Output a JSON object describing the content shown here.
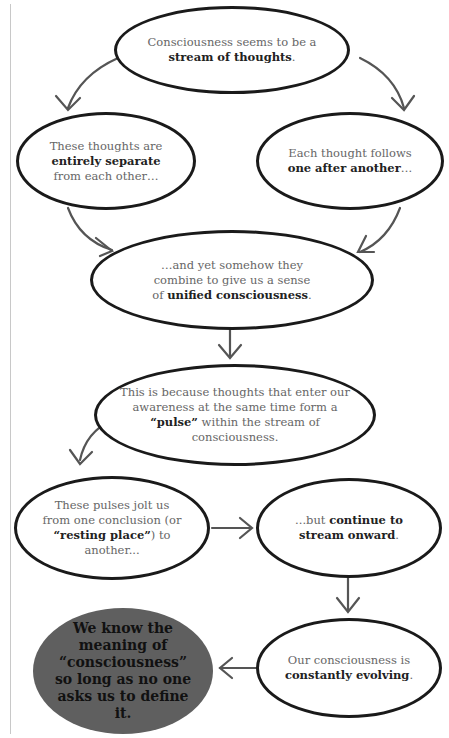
{
  "diagram": {
    "type": "flowchart",
    "nodes": [
      {
        "id": "n1",
        "pre": "Consciousness seems to be a ",
        "bold": "stream of thoughts",
        "post": "."
      },
      {
        "id": "n2",
        "pre": "These thoughts are ",
        "bold": "entirely separate",
        "post": " from each other…"
      },
      {
        "id": "n3",
        "pre": "Each thought follows ",
        "bold": "one after another",
        "post": "…"
      },
      {
        "id": "n4",
        "pre": "…and yet somehow they combine to give us a sense of ",
        "bold": "unified consciousness",
        "post": "."
      },
      {
        "id": "n5",
        "pre": "This is because thoughts that enter our awareness at the same time form a ",
        "bold": "“pulse”",
        "post": " within the stream of consciousness."
      },
      {
        "id": "n6",
        "pre": "These pulses jolt us from one conclusion (or ",
        "bold": "“resting place”",
        "post": ") to another..."
      },
      {
        "id": "n7",
        "pre": "...but ",
        "bold": "continue to stream onward",
        "post": "."
      },
      {
        "id": "n8",
        "pre": "Our consciousness is ",
        "bold": "constantly evolving",
        "post": "."
      },
      {
        "id": "n9",
        "text": "We know the meaning of “consciousness” so long as no one asks us to define it."
      }
    ],
    "edges": [
      [
        "n1",
        "n2"
      ],
      [
        "n1",
        "n3"
      ],
      [
        "n2",
        "n4"
      ],
      [
        "n3",
        "n4"
      ],
      [
        "n4",
        "n5"
      ],
      [
        "n5",
        "n6"
      ],
      [
        "n6",
        "n7"
      ],
      [
        "n7",
        "n8"
      ],
      [
        "n8",
        "n9"
      ]
    ],
    "colors": {
      "stroke": "#1a1a1a",
      "arrow": "#555555",
      "final_fill": "#5f5f5f",
      "body_text": "#666666",
      "bold_text": "#222222"
    }
  }
}
